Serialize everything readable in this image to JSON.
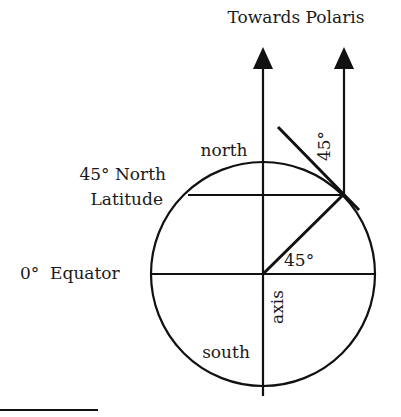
{
  "diagram": {
    "title_label": "Towards Polaris",
    "labels": {
      "north": "north",
      "south": "south",
      "latitude_line1": "45° North",
      "latitude_line2": "Latitude",
      "equator": "0°  Equator",
      "axis": "axis",
      "angle_center": "45°",
      "angle_tangent": "45°"
    },
    "colors": {
      "ink": "#111111",
      "background": "#ffffff"
    }
  }
}
